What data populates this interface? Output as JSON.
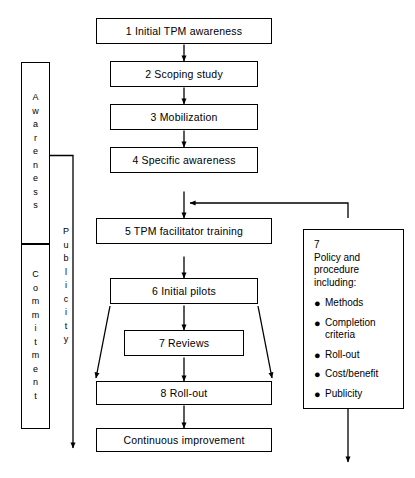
{
  "diagram": {
    "background": "#ffffff",
    "line_color": "#000000"
  },
  "phases": {
    "awareness": {
      "label": "Awareness",
      "letters": [
        "A",
        "w",
        "a",
        "r",
        "e",
        "n",
        "e",
        "s",
        "s"
      ]
    },
    "commitment": {
      "label": "Commitment",
      "letters": [
        "C",
        "o",
        "m",
        "m",
        "i",
        "t",
        "m",
        "e",
        "n",
        "t"
      ]
    },
    "publicity": {
      "label": "Publicity",
      "letters": [
        "P",
        "u",
        "b",
        "l",
        "i",
        "c",
        "i",
        "t",
        "y"
      ]
    }
  },
  "steps": [
    {
      "id": "step1",
      "number": "1",
      "label": "1  Initial TPM awareness"
    },
    {
      "id": "step2",
      "number": "2",
      "label": "2  Scoping study"
    },
    {
      "id": "step3",
      "number": "3",
      "label": "3  Mobilization"
    },
    {
      "id": "step4",
      "number": "4",
      "label": "4  Specific awareness"
    },
    {
      "id": "step5",
      "number": "5",
      "label": "5  TPM facilitator training"
    },
    {
      "id": "step6",
      "number": "6",
      "label": "6  Initial pilots"
    },
    {
      "id": "step7",
      "number": "7",
      "label": "7  Reviews"
    },
    {
      "id": "step8",
      "number": "8",
      "label": "8  Roll-out"
    },
    {
      "id": "step9",
      "number": "",
      "label": "Continuous improvement"
    }
  ],
  "policy": {
    "number": "7",
    "title": "Policy and procedure including:",
    "items": [
      "Methods",
      "Completion criteria",
      "Roll-out",
      "Cost/benefit",
      "Publicity"
    ],
    "bullet": "●"
  }
}
